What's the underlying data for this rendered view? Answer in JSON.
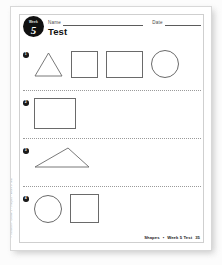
{
  "page": {
    "badge": {
      "top_label": "Week",
      "number": "5"
    },
    "name_label": "Name",
    "date_label": "Date",
    "title": "Test",
    "copyright": "© Harcourt • Grade 1 • Shapes • Week 5 Test"
  },
  "problems": [
    {
      "number": "1",
      "shapes": [
        "triangle",
        "square",
        "rectangle",
        "circle"
      ]
    },
    {
      "number": "2",
      "shapes": [
        "rectangle"
      ]
    },
    {
      "number": "3",
      "shapes": [
        "scalene-triangle"
      ]
    },
    {
      "number": "4",
      "shapes": [
        "circle",
        "square"
      ]
    }
  ],
  "footer": {
    "subject": "Shapes",
    "separator": "•",
    "assessment": "Week 5 Test",
    "page_number": "35"
  }
}
